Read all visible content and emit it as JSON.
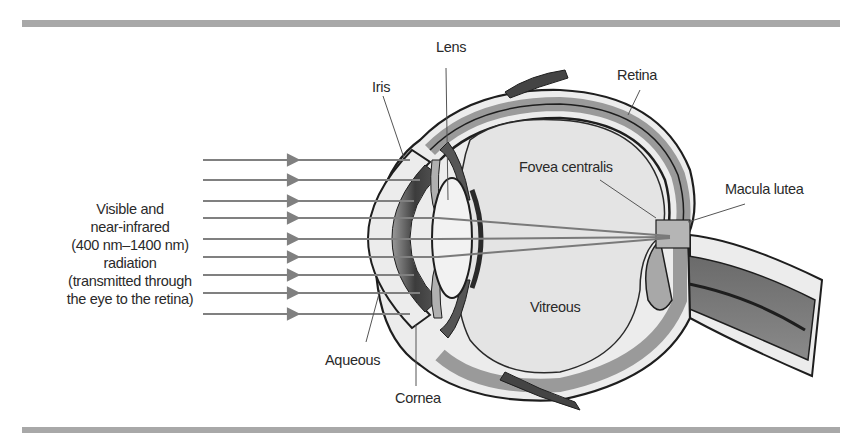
{
  "diagram": {
    "source_text": {
      "lines": [
        "Visible and",
        "near-infrared",
        "(400 nm–1400 nm)",
        "radiation",
        "(transmitted through",
        "the eye to the retina)"
      ]
    },
    "rays": {
      "count": 9,
      "y_positions": [
        160,
        180,
        201,
        218,
        239,
        257,
        275,
        293,
        314
      ],
      "color": "#808080"
    },
    "labels": {
      "lens": "Lens",
      "iris": "Iris",
      "retina": "Retina",
      "fovea": "Fovea centralis",
      "macula": "Macula lutea",
      "vitreous": "Vitreous",
      "aqueous": "Aqueous",
      "cornea": "Cornea"
    },
    "colors": {
      "rule": "#a8a8a8",
      "outline": "#1e1e1e",
      "vitreous_fill": "#e4e4e4",
      "retina_band": "#9a9a9a",
      "optic_nerve": "#7a7a7a",
      "sclera": "#ececec",
      "iris_dark": "#3a3a3a",
      "text": "#2a2a2a"
    }
  }
}
